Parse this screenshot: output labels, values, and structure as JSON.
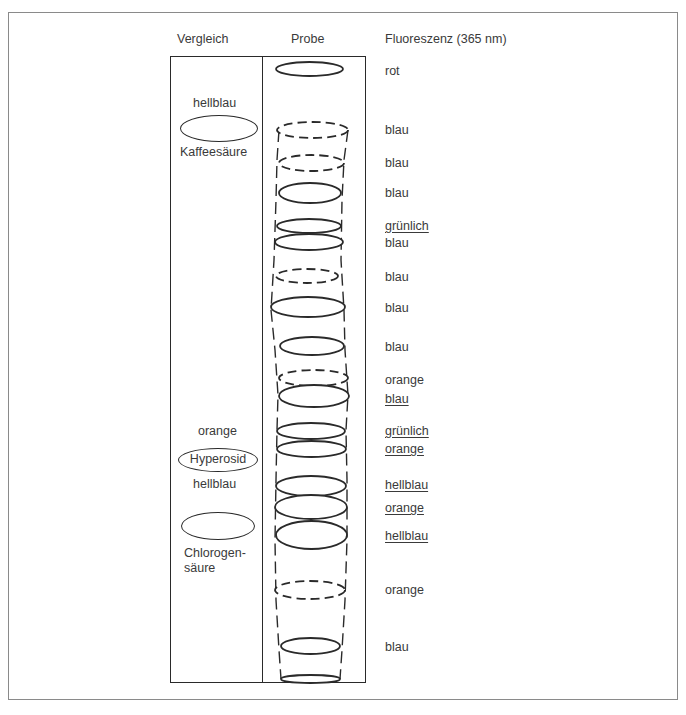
{
  "headers": {
    "reference": "Vergleich",
    "sample": "Probe",
    "fluorescence": "Fluoreszenz (365 nm)"
  },
  "reference_lane": {
    "items": [
      {
        "label_above": "hellblau",
        "name": "Kaffeesäure"
      },
      {
        "label_above": "orange",
        "name": "Hyperosid",
        "label_below": "hellblau"
      },
      {
        "name_line1": "Chlorogen-",
        "name_line2": "säure"
      }
    ]
  },
  "sample_spots": [
    {
      "y": 69,
      "x1": 276,
      "x2": 343,
      "h": 14,
      "style": "solid",
      "colors": [
        "rot"
      ]
    },
    {
      "y": 130,
      "x1": 277,
      "x2": 348,
      "h": 16,
      "style": "dashed",
      "colors": [
        "blau"
      ]
    },
    {
      "y": 163,
      "x1": 279,
      "x2": 344,
      "h": 16,
      "style": "dashed",
      "colors": [
        "blau"
      ]
    },
    {
      "y": 193,
      "x1": 279,
      "x2": 341,
      "h": 20,
      "style": "solid",
      "colors": [
        "blau"
      ]
    },
    {
      "y": 226,
      "x1": 277,
      "x2": 341,
      "h": 14,
      "style": "solid",
      "colors": [
        "grünlich"
      ]
    },
    {
      "y": 242,
      "x1": 275,
      "x2": 343,
      "h": 16,
      "style": "solid",
      "colors": [
        "blau"
      ]
    },
    {
      "y": 276,
      "x1": 276,
      "x2": 338,
      "h": 14,
      "style": "dashed",
      "colors": [
        "blau"
      ]
    },
    {
      "y": 307,
      "x1": 271,
      "x2": 345,
      "h": 20,
      "style": "solid",
      "colors": [
        "blau"
      ]
    },
    {
      "y": 346,
      "x1": 280,
      "x2": 344,
      "h": 18,
      "style": "solid",
      "colors": [
        "blau"
      ]
    },
    {
      "y": 378,
      "x1": 279,
      "x2": 348,
      "h": 16,
      "style": "dashed",
      "colors": [
        "orange"
      ]
    },
    {
      "y": 396,
      "x1": 279,
      "x2": 349,
      "h": 22,
      "style": "solid",
      "colors": [
        "blau"
      ]
    },
    {
      "y": 431,
      "x1": 277,
      "x2": 345,
      "h": 16,
      "style": "solid",
      "colors": [
        "grünlich"
      ]
    },
    {
      "y": 449,
      "x1": 277,
      "x2": 346,
      "h": 16,
      "style": "solid",
      "colors": [
        "orange"
      ]
    },
    {
      "y": 486,
      "x1": 276,
      "x2": 346,
      "h": 20,
      "style": "solid",
      "colors": [
        "hellblau"
      ]
    },
    {
      "y": 507,
      "x1": 275,
      "x2": 347,
      "h": 24,
      "style": "solid",
      "colors": [
        "orange"
      ]
    },
    {
      "y": 535,
      "x1": 276,
      "x2": 347,
      "h": 28,
      "style": "solid",
      "colors": [
        "hellblau"
      ]
    },
    {
      "y": 590,
      "x1": 275,
      "x2": 345,
      "h": 18,
      "style": "dashed",
      "colors": [
        "orange"
      ]
    },
    {
      "y": 646,
      "x1": 281,
      "x2": 340,
      "h": 16,
      "style": "solid",
      "colors": [
        "blau"
      ]
    },
    {
      "y": 679,
      "x1": 281,
      "x2": 340,
      "h": 8,
      "style": "solid",
      "colors": []
    }
  ],
  "fluorescence_labels": [
    {
      "text": "rot",
      "y": 64,
      "underline": false
    },
    {
      "text": "blau",
      "y": 123,
      "underline": false
    },
    {
      "text": "blau",
      "y": 156,
      "underline": false
    },
    {
      "text": "blau",
      "y": 186,
      "underline": false
    },
    {
      "text": "grünlich",
      "y": 219,
      "underline": true
    },
    {
      "text": "blau",
      "y": 236,
      "underline": false
    },
    {
      "text": "blau",
      "y": 270,
      "underline": false
    },
    {
      "text": "blau",
      "y": 301,
      "underline": false
    },
    {
      "text": "blau",
      "y": 340,
      "underline": false
    },
    {
      "text": "orange",
      "y": 373,
      "underline": false
    },
    {
      "text": "blau",
      "y": 392,
      "underline": true
    },
    {
      "text": "grünlich",
      "y": 424,
      "underline": true
    },
    {
      "text": "orange",
      "y": 442,
      "underline": true
    },
    {
      "text": "hellblau",
      "y": 478,
      "underline": true
    },
    {
      "text": "orange",
      "y": 501,
      "underline": true
    },
    {
      "text": "hellblau",
      "y": 529,
      "underline": true
    },
    {
      "text": "orange",
      "y": 583,
      "underline": false
    },
    {
      "text": "blau",
      "y": 640,
      "underline": false
    }
  ]
}
